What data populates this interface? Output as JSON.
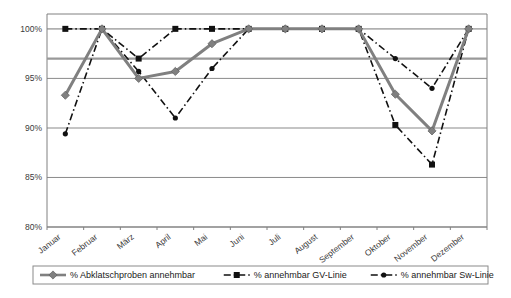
{
  "chart_data": {
    "type": "line",
    "title": "",
    "subtitle": "",
    "xlabel": "",
    "ylabel": "",
    "categories": [
      "Januar",
      "Februar",
      "März",
      "April",
      "Mai",
      "Juni",
      "Juli",
      "August",
      "September",
      "Oktober",
      "November",
      "Dezember"
    ],
    "ylim": [
      80,
      101.5
    ],
    "ytick_labels": [
      "80%",
      "85%",
      "90%",
      "95%",
      "100%"
    ],
    "ytick_values": [
      80,
      85,
      90,
      95,
      100
    ],
    "grid": true,
    "grid_axis": "y",
    "legend_position": "bottom",
    "reference_lines": [
      {
        "name": "warning-threshold",
        "value": 97,
        "color": "#999999",
        "width": 2.2
      }
    ],
    "series": [
      {
        "name": "% Abklatschproben annehmbar",
        "legend_label": "% Abklatschproben annehmbar",
        "color": "#808080",
        "marker": "diamond",
        "linestyle": "solid",
        "linewidth": 3,
        "values": [
          93.3,
          100.0,
          95.0,
          95.7,
          98.5,
          100.0,
          100.0,
          100.0,
          100.0,
          93.4,
          89.7,
          100.0
        ]
      },
      {
        "name": "% annehmbar GV-Linie",
        "legend_label": "% annehmbar GV-Linie",
        "color": "#111111",
        "marker": "square",
        "linestyle": "dashdot",
        "linewidth": 1.6,
        "values": [
          100.0,
          100.0,
          97.0,
          100.0,
          100.0,
          100.0,
          100.0,
          100.0,
          100.0,
          90.3,
          86.3,
          100.0
        ]
      },
      {
        "name": "% annehmbar Sw-Linie",
        "legend_label": "% annehmbar Sw-Linie",
        "color": "#111111",
        "marker": "circle",
        "linestyle": "dashdot",
        "linewidth": 1.6,
        "values": [
          89.4,
          100.0,
          95.7,
          91.0,
          96.0,
          100.0,
          100.0,
          100.0,
          100.0,
          97.0,
          94.0,
          100.0
        ]
      }
    ]
  },
  "legend": {
    "items": [
      {
        "label": "% Abklatschproben annehmbar",
        "marker": "diamond",
        "color": "#808080",
        "style": "solid"
      },
      {
        "label": "% annehmbar GV-Linie",
        "marker": "square",
        "color": "#111111",
        "style": "dashdot"
      },
      {
        "label": "% annehmbar Sw-Linie",
        "marker": "circle",
        "color": "#111111",
        "style": "dashdot"
      }
    ]
  },
  "axes": {
    "y_labels": [
      "100%",
      "95%",
      "90%",
      "85%",
      "80%"
    ],
    "x_labels": [
      "Januar",
      "Februar",
      "März",
      "April",
      "Mai",
      "Juni",
      "Juli",
      "August",
      "September",
      "Oktober",
      "November",
      "Dezember"
    ]
  },
  "colors": {
    "plot_border": "#808080",
    "gridline": "#8a8a8a",
    "gridline_light": "#b0b0b0",
    "series_primary": "#808080",
    "series_secondary": "#111111",
    "background": "#ffffff"
  }
}
